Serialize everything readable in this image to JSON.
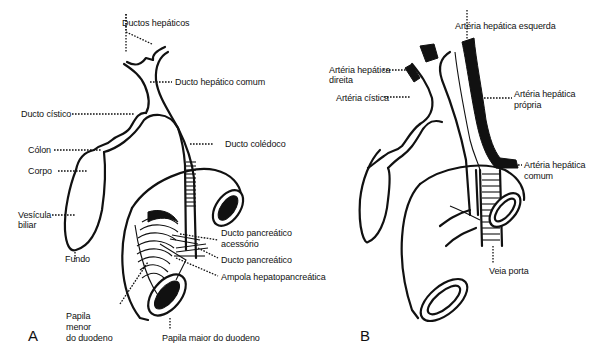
{
  "figure": {
    "panels": [
      {
        "letter": "A",
        "labels": {
          "ductos_hepaticos": "Ductos hepáticos",
          "ducto_hepatico_comum": "Ducto hepático comum",
          "ducto_cistico": "Ducto cístico",
          "colon": "Cólon",
          "corpo": "Corpo",
          "vesicula_1": "Vesícula",
          "vesicula_2": "biliar",
          "fundo": "Fundo",
          "ducto_coledoco": "Ducto colédoco",
          "ducto_pancreatico_acessorio_1": "Ducto pancreático",
          "ducto_pancreatico_acessorio_2": "acessório",
          "ducto_pancreatico": "Ducto pancreático",
          "ampola": "Ampola hepatopancreática",
          "papila_menor_1": "Papila",
          "papila_menor_2": "menor",
          "papila_menor_3": "do duodeno",
          "papila_maior": "Papila maior do duodeno"
        }
      },
      {
        "letter": "B",
        "labels": {
          "arteria_hepatica_esquerda": "Artéria hepática esquerda",
          "arteria_hepatica_direita_1": "Artéria hepática",
          "arteria_hepatica_direita_2": "direita",
          "arteria_cistica": "Artéria cística",
          "arteria_hepatica_propria_1": "Artéria hepática",
          "arteria_hepatica_propria_2": "própria",
          "arteria_hepatica_comum_1": "Artéria hepática",
          "arteria_hepatica_comum_2": "comum",
          "veia_porta": "Veia porta"
        }
      }
    ]
  }
}
